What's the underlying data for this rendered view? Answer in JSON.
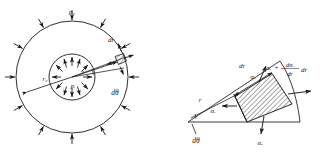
{
  "figure": {
    "type": "engineering-stress-diagram",
    "ink_color": "#1a1a1a",
    "background_color": "#ffffff"
  },
  "left_diagram": {
    "name": "cylinder-cross-section",
    "outer_pressure_label": "p₀",
    "inner_pressure_label": "pᵢ",
    "outer_radius_label": "r₀",
    "inner_radius_label": "r",
    "element_thickness_label": "dr",
    "element_angle_label": "dθ",
    "outer_arrow_count": 12,
    "inner_arrow_count": 12,
    "outer_arrow_direction": "inward",
    "inner_arrow_direction": "outward",
    "center": [
      72,
      77
    ],
    "outer_radius_px": 56,
    "inner_radius_px": 23
  },
  "right_diagram": {
    "name": "stress-element-free-body",
    "radial_stress_label": "σᵣ",
    "hoop_stress_label_top": "σₒ",
    "hoop_stress_label_bottom": "σₒ",
    "radius_label": "r",
    "thickness_label": "dr",
    "angle_label": "dθ",
    "gradient_expression": {
      "base": "σᵣ",
      "operator": "+",
      "numerator": "dσᵣ",
      "denominator": "dr",
      "multiplier": "dr",
      "full": "σᵣ + (dσᵣ/dr)dr"
    },
    "apex": [
      188,
      122
    ],
    "hatched": true
  }
}
